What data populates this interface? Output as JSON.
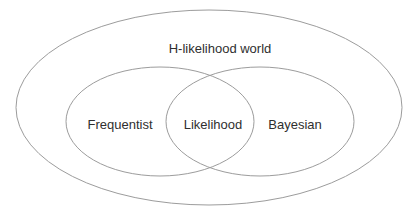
{
  "diagram": {
    "type": "venn",
    "outer": {
      "label": "H-likelihood world",
      "cx": 209,
      "cy": 107.5,
      "rx": 193,
      "ry": 97.5
    },
    "sets": [
      {
        "label": "Frequentist",
        "cx": 160,
        "cy": 121.5,
        "rx": 94,
        "ry": 54.5
      },
      {
        "label": "Bayesian",
        "cx": 260,
        "cy": 121.5,
        "rx": 94,
        "ry": 54.5
      }
    ],
    "intersection": {
      "label": "Likelihood"
    },
    "stroke_color": "#9c9c9c",
    "text_color": "#2f2f2f",
    "background": "#ffffff"
  }
}
